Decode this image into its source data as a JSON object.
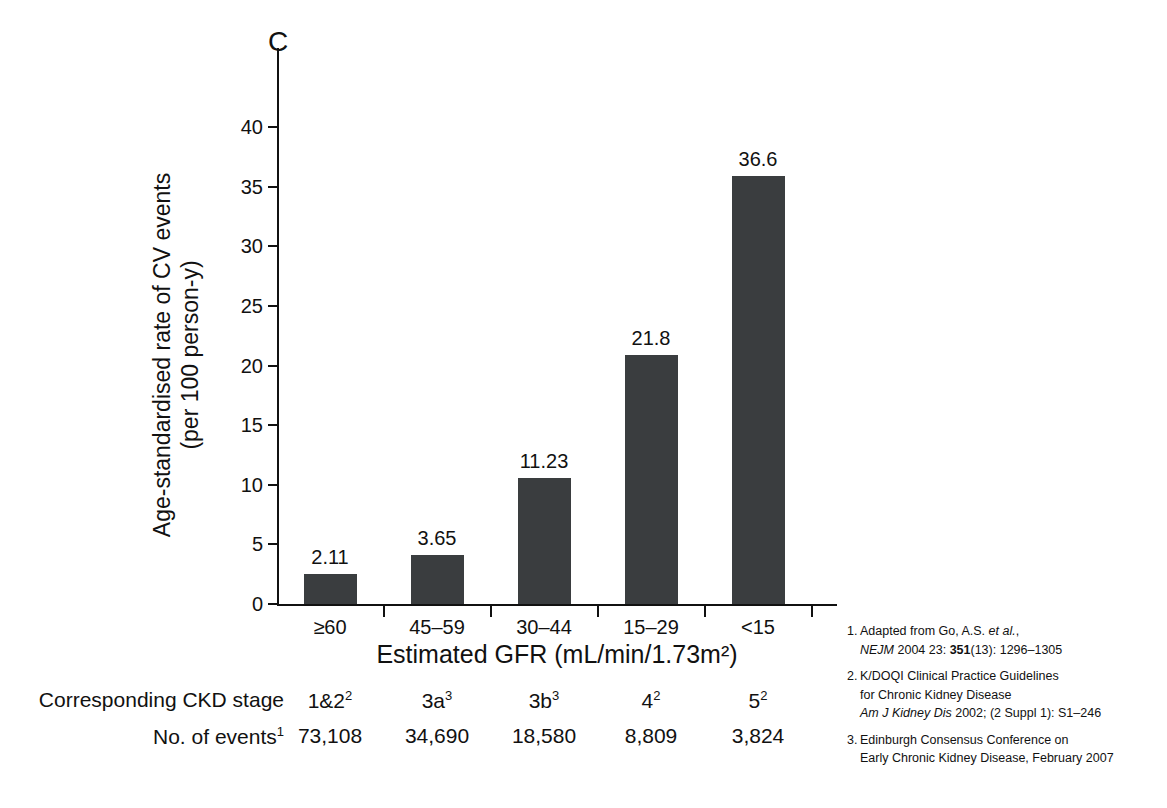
{
  "panel_label": "C",
  "chart_data": {
    "type": "bar",
    "title": "",
    "categories": [
      "≥60",
      "45–59",
      "30–44",
      "15–29",
      "<15"
    ],
    "values": [
      2.11,
      3.65,
      11.23,
      21.8,
      36.6
    ],
    "value_labels": [
      "2.11",
      "3.65",
      "11.23",
      "21.8",
      "36.6"
    ],
    "bar_draw_heights": [
      2.5,
      4.1,
      10.6,
      20.9,
      35.9
    ],
    "xlabel": "Estimated GFR (mL/min/1.73m²)",
    "ylabel": "Age-standardised rate of CV events (per 100 person-y)",
    "ylabel_line1": "Age-standardised rate of CV events",
    "ylabel_line2": "(per 100 person-y)",
    "ylim": [
      0,
      40
    ],
    "ytick_values": [
      0,
      5,
      10,
      15,
      20,
      25,
      30,
      35,
      40
    ],
    "ytick_labels": [
      "0",
      "5",
      "10",
      "15",
      "20",
      "25",
      "30",
      "35",
      "40"
    ],
    "grid": false,
    "legend": "none",
    "bar_color": "#3a3d3f",
    "axis_color": "#111111"
  },
  "table": {
    "rows": [
      {
        "label_text": "Corresponding CKD stage",
        "label_sup": "",
        "cells": [
          {
            "text": "1&2",
            "sup": "2"
          },
          {
            "text": "3a",
            "sup": "3"
          },
          {
            "text": "3b",
            "sup": "3"
          },
          {
            "text": "4",
            "sup": "2"
          },
          {
            "text": "5",
            "sup": "2"
          }
        ]
      },
      {
        "label_text": "No. of events",
        "label_sup": "1",
        "cells": [
          {
            "text": "73,108",
            "sup": ""
          },
          {
            "text": "34,690",
            "sup": ""
          },
          {
            "text": "18,580",
            "sup": ""
          },
          {
            "text": "8,809",
            "sup": ""
          },
          {
            "text": "3,824",
            "sup": ""
          }
        ]
      }
    ]
  },
  "footnotes": [
    {
      "num": "1.",
      "lines": [
        [
          {
            "t": "Adapted from Go, A.S. ",
            "style": "normal"
          },
          {
            "t": "et al.",
            "style": "italic"
          },
          {
            "t": ",",
            "style": "normal"
          }
        ],
        [
          {
            "t": "NEJM",
            "style": "italic"
          },
          {
            "t": " 2004 23: ",
            "style": "normal"
          },
          {
            "t": "351",
            "style": "bold"
          },
          {
            "t": "(13): 1296–1305",
            "style": "normal"
          }
        ]
      ]
    },
    {
      "num": "2.",
      "lines": [
        [
          {
            "t": "K/DOQI  Clinical Practice Guidelines",
            "style": "normal"
          }
        ],
        [
          {
            "t": "for Chronic Kidney Disease",
            "style": "normal"
          }
        ],
        [
          {
            "t": "Am J Kidney Dis",
            "style": "italic"
          },
          {
            "t": " 2002; (2 Suppl 1): S1–246",
            "style": "normal"
          }
        ]
      ]
    },
    {
      "num": "3.",
      "lines": [
        [
          {
            "t": "Edinburgh Consensus Conference on",
            "style": "normal"
          }
        ],
        [
          {
            "t": "Early Chronic Kidney Disease, February 2007",
            "style": "normal"
          }
        ]
      ]
    }
  ]
}
